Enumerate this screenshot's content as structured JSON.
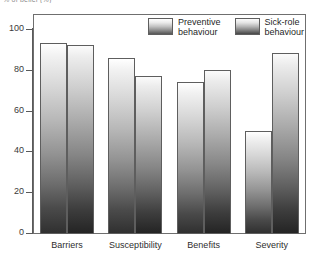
{
  "top_caption": "% of belief (%)",
  "chart_data": {
    "type": "bar",
    "title": "",
    "xlabel": "",
    "ylabel": "",
    "ylim": [
      0,
      100
    ],
    "yticks": [
      0,
      20,
      40,
      60,
      80,
      100
    ],
    "ytick_labels": [
      "0",
      "20",
      "40",
      "60",
      "80",
      "100"
    ],
    "grid": false,
    "legend_position": "top-right",
    "categories": [
      "Barriers",
      "Susceptibility",
      "Benefits",
      "Severity"
    ],
    "series": [
      {
        "name": "Preventive behaviour",
        "name_line1": "Preventive",
        "name_line2": "behaviour",
        "values": [
          93,
          86,
          74,
          50
        ]
      },
      {
        "name": "Sick-role behaviour",
        "name_line1": "Sick-role",
        "name_line2": "behaviour",
        "values": [
          92,
          77,
          80,
          88
        ]
      }
    ]
  }
}
